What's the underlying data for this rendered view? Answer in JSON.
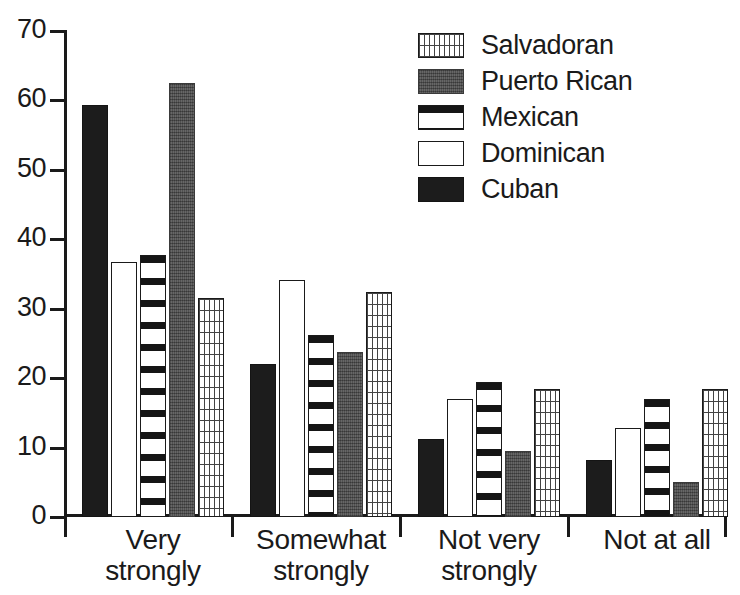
{
  "chart_data": {
    "type": "bar",
    "title": "",
    "xlabel": "",
    "ylabel": "",
    "ylim": [
      0,
      70
    ],
    "ytick_step": 10,
    "yticks": [
      70,
      60,
      50,
      40,
      30,
      20,
      10,
      0
    ],
    "grid": false,
    "legend_position": "top-right",
    "categories": [
      "Very strongly",
      "Somewhat strongly",
      "Not very strongly",
      "Not at all"
    ],
    "category_lines": [
      [
        "Very",
        "strongly"
      ],
      [
        "Somewhat",
        "strongly"
      ],
      [
        "Not very",
        "strongly"
      ],
      [
        "Not at all",
        ""
      ]
    ],
    "series": [
      {
        "name": "Cuban",
        "pattern": "solid-black",
        "values": [
          59.3,
          22.0,
          11.2,
          8.2
        ]
      },
      {
        "name": "Dominican",
        "pattern": "white",
        "values": [
          36.8,
          34.2,
          17.0,
          12.8
        ]
      },
      {
        "name": "Mexican",
        "pattern": "horizontal-stripes",
        "values": [
          37.7,
          26.2,
          19.5,
          17.0
        ]
      },
      {
        "name": "Puerto Rican",
        "pattern": "gray-stipple",
        "values": [
          62.5,
          23.8,
          9.5,
          5.1
        ]
      },
      {
        "name": "Salvadoran",
        "pattern": "cross-hatch",
        "values": [
          31.5,
          32.4,
          18.5,
          18.5
        ]
      }
    ],
    "legend_order": [
      "Salvadoran",
      "Puerto Rican",
      "Mexican",
      "Dominican",
      "Cuban"
    ],
    "bar_order": [
      "Cuban",
      "Dominican",
      "Mexican",
      "Puerto Rican",
      "Salvadoran"
    ],
    "colors": {
      "cuban": "#1c1c1c",
      "dominican": "#ffffff",
      "mexican": "#151515",
      "puerto_rican": "#585858",
      "salvadoran": "#444444",
      "axis": "#1a1a1a",
      "background": "#ffffff"
    }
  }
}
